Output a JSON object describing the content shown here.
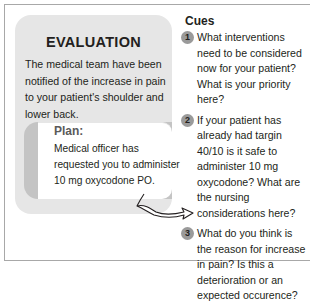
{
  "evaluation": {
    "title": "EVALUATION",
    "body": "The medical team have been notified of the increase in pain to your patient's shoulder and lower back.",
    "plan": {
      "title": "Plan:",
      "body": "Medical officer has requested you to administer 10 mg oxycodone PO."
    }
  },
  "cues": {
    "title": "Cues",
    "items": [
      {
        "number": "1",
        "text": "What interventions need to be considered now for your patient? What is your priority here?"
      },
      {
        "number": "2",
        "text": "If your patient has already had targin 40/10 is it safe to administer 10 mg oxycodone? What are the nursing considerations here?"
      },
      {
        "number": "3",
        "text": "What do you think is the reason for increase in pain? Is this a deterioration or an expected occurence?"
      }
    ]
  },
  "colors": {
    "panel_bg": "#e6e6e6",
    "plan_accent": "#c4c4c4",
    "cue_badge": "#9a9a9a",
    "frame_border": "#a8a8a8",
    "text": "#231f20"
  },
  "icons": {
    "connector": "curved-arrow-icon"
  }
}
